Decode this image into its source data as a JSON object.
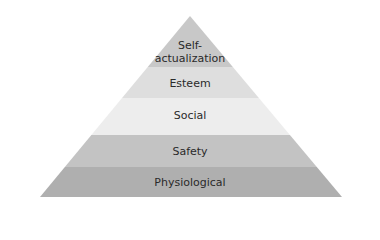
{
  "diagram": {
    "type": "pyramid",
    "apex": {
      "x": 190,
      "y": 16
    },
    "base": {
      "left": 40,
      "right": 342,
      "y": 197
    },
    "levels": [
      {
        "label": "Self-actualization",
        "line1": "Self-",
        "line2": "actualization",
        "top": 16,
        "bottom": 67,
        "color": "#c8c8c8"
      },
      {
        "label": "Esteem",
        "top": 67,
        "bottom": 98,
        "color": "#dedede"
      },
      {
        "label": "Social",
        "top": 98,
        "bottom": 135,
        "color": "#ededed"
      },
      {
        "label": "Safety",
        "top": 135,
        "bottom": 167,
        "color": "#c3c3c3"
      },
      {
        "label": "Physiological",
        "top": 167,
        "bottom": 197,
        "color": "#afafaf"
      }
    ]
  }
}
